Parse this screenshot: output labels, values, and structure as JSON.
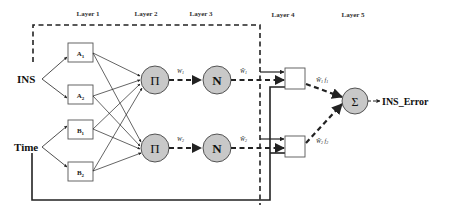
{
  "diagram": {
    "type": "ANFIS architecture",
    "layers": [
      {
        "label": "Layer 1",
        "x": 88
      },
      {
        "label": "Layer 2",
        "x": 146
      },
      {
        "label": "Layer 3",
        "x": 201
      },
      {
        "label": "Layer 4",
        "x": 283
      },
      {
        "label": "Layer 5",
        "x": 353
      }
    ],
    "inputs": [
      {
        "label": "INS",
        "y": 79
      },
      {
        "label": "Time",
        "y": 147
      }
    ],
    "membership_boxes": [
      {
        "label": "A",
        "sub": "1"
      },
      {
        "label": "A",
        "sub": "2"
      },
      {
        "label": "B",
        "sub": "1"
      },
      {
        "label": "B",
        "sub": "2"
      }
    ],
    "product_nodes": [
      {
        "symbol": "Π",
        "weight_label": "W",
        "weight_sub": "1"
      },
      {
        "symbol": "Π",
        "weight_label": "W",
        "weight_sub": "2"
      }
    ],
    "norm_nodes": [
      {
        "symbol": "N",
        "weight_label": "W̄",
        "weight_sub": "1"
      },
      {
        "symbol": "N",
        "weight_label": "W̄",
        "weight_sub": "2"
      }
    ],
    "consequent_labels": [
      {
        "w": "W̄",
        "wsub": "1",
        "f": "f",
        "fsub": "1"
      },
      {
        "w": "W̄",
        "wsub": "2",
        "f": "f",
        "fsub": "2"
      }
    ],
    "sum_node": {
      "symbol": "Σ"
    },
    "output": {
      "label": "INS_Error"
    },
    "colors": {
      "node_fill": "#c8c8c8",
      "stroke": "#222222",
      "box_stroke": "#555555",
      "background": "#ffffff"
    }
  }
}
